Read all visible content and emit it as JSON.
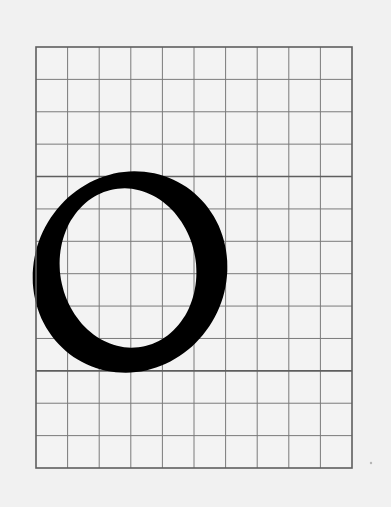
{
  "figure": {
    "letter": "O",
    "background_color": "#f1f1f1",
    "paper_color": "#f3f3f3",
    "grid_color": "#7a7a7a",
    "grid_major_color": "#5e5e5e",
    "ink_color": "#000000"
  },
  "grid": {
    "left": 36,
    "top": 47,
    "right": 352,
    "bottom": 468,
    "columns": 10,
    "rows": 13,
    "major_rows": [
      4,
      10
    ]
  },
  "glyph": {
    "outer": {
      "cx": 130,
      "cy": 272,
      "rx": 96,
      "ry": 102,
      "rotate": 28
    },
    "inner": {
      "cx": 128,
      "cy": 268,
      "rx": 68,
      "ry": 80,
      "rotate": -10
    }
  }
}
